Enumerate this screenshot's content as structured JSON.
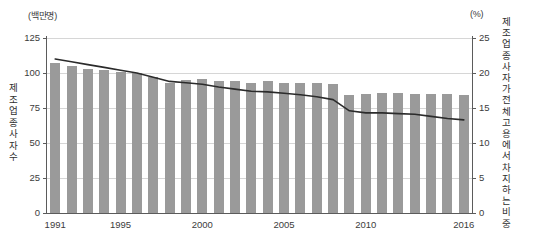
{
  "axes": {
    "left_unit": "(백만명)",
    "right_unit": "(%)",
    "left_title": "제조업 종사자수",
    "right_title": "제조업 종사자가 전체 고용에서 차지하는 비중"
  },
  "chart_data": {
    "type": "bar",
    "title": "",
    "subtitle": "",
    "xlabel": "",
    "ylabel": "제조업 종사자수",
    "y2label": "제조업 종사자가 전체 고용에서 차지하는 비중",
    "y_unit": "백만명",
    "y2_unit": "%",
    "grid": true,
    "legend": false,
    "ylim": [
      0,
      125
    ],
    "y2lim": [
      0,
      25
    ],
    "yticks": [
      0,
      25,
      50,
      75,
      100,
      125
    ],
    "y2ticks": [
      0,
      5,
      10,
      15,
      20,
      25
    ],
    "xticks": [
      1991,
      1995,
      2000,
      2005,
      2010,
      2016
    ],
    "xtick_labels": [
      "1991",
      "1995",
      "2000",
      "2005",
      "2010",
      "2016"
    ],
    "categories": [
      1991,
      1992,
      1993,
      1994,
      1995,
      1996,
      1997,
      1998,
      1999,
      2000,
      2001,
      2002,
      2003,
      2004,
      2005,
      2006,
      2007,
      2008,
      2009,
      2010,
      2011,
      2012,
      2013,
      2014,
      2015,
      2016
    ],
    "series": [
      {
        "name": "제조업 종사자수",
        "type": "bar",
        "axis": "left",
        "unit": "백만명",
        "color": "#9a9a9a",
        "values": [
          107,
          105,
          103,
          102,
          101,
          100,
          97,
          93,
          95,
          96,
          94,
          94,
          93,
          94,
          93,
          93,
          93,
          92,
          84,
          85,
          86,
          86,
          85,
          85,
          85,
          84
        ]
      },
      {
        "name": "제조업 종사자가 전체 고용에서 차지하는 비중",
        "type": "line",
        "axis": "right",
        "unit": "%",
        "color": "#2b2b2b",
        "values": [
          22.0,
          21.6,
          21.2,
          20.8,
          20.4,
          20.0,
          19.4,
          18.8,
          18.6,
          18.4,
          18.0,
          17.7,
          17.4,
          17.3,
          17.1,
          16.9,
          16.6,
          16.2,
          14.6,
          14.3,
          14.3,
          14.2,
          14.1,
          13.8,
          13.5,
          13.3
        ]
      }
    ]
  }
}
